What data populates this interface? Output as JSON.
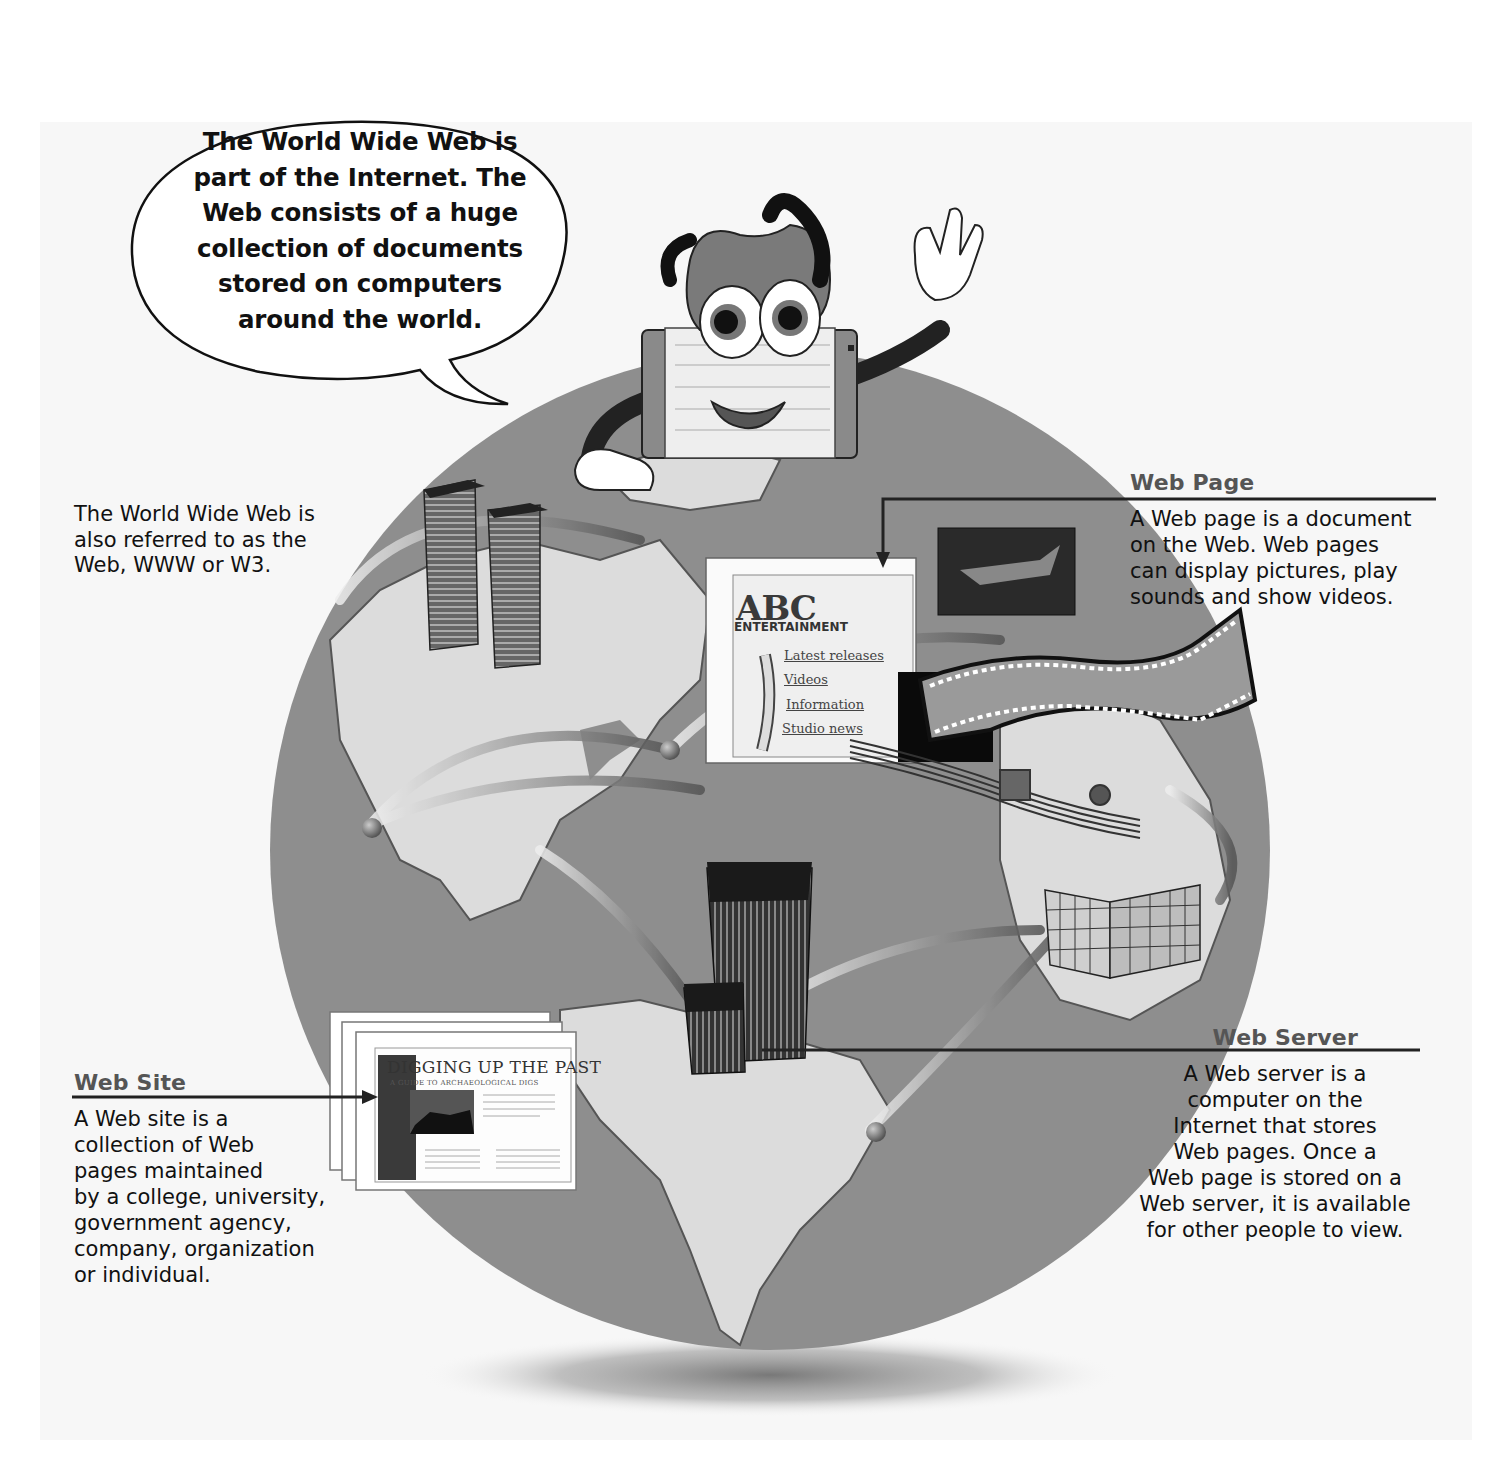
{
  "speech_bubble": {
    "lines": [
      "The World Wide Web is",
      "part of the Internet. The",
      "Web consists of a huge",
      "collection of documents",
      "stored on computers",
      "around the world."
    ]
  },
  "aka_note": {
    "lines": [
      "The World Wide Web is",
      "also referred to as the",
      "Web, WWW or W3."
    ]
  },
  "web_page": {
    "heading": "Web Page",
    "lines": [
      "A Web page is a document",
      "on the Web. Web pages",
      "can display pictures, play",
      "sounds and show videos."
    ]
  },
  "web_site": {
    "heading": "Web Site",
    "lines": [
      "A Web site is a",
      "collection of Web",
      "pages maintained",
      "by a college, university,",
      "government agency,",
      "company, organization",
      "or individual."
    ]
  },
  "web_server": {
    "heading": "Web Server",
    "lines": [
      "A Web server is a",
      "computer on the",
      "Internet that stores",
      "Web pages. Once a",
      "Web page is stored on a",
      "Web server, it is available",
      "for other people to view."
    ]
  },
  "sample_web_page": {
    "logo": "ABC",
    "logo_sub": "ENTERTAINMENT",
    "links": [
      "Latest releases",
      "Videos",
      "Information",
      "Studio news"
    ]
  },
  "sample_web_site": {
    "title": "DIGGING UP THE PAST",
    "subtitle": "A GUIDE TO ARCHAEOLOGICAL DIGS"
  },
  "colors": {
    "background": "#ffffff",
    "panel": "#f7f7f7",
    "ocean": "#8e8e8e",
    "land": "#dcdcdc",
    "heading_gray": "#555555",
    "text": "#111111"
  }
}
